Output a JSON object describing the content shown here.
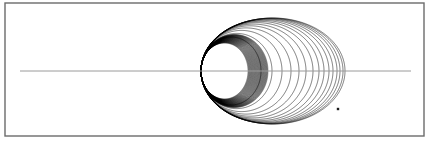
{
  "figure": {
    "title": "",
    "background_color": "#ffffff",
    "width": 429,
    "height": 145
  },
  "frame": {
    "name": "figure-border",
    "x": 5,
    "y": 3,
    "width": 419,
    "height": 133,
    "stroke_color": "#6b6b6b",
    "stroke_width": 1.4,
    "fill": "none"
  },
  "axis": {
    "name": "horizontal-axis-line",
    "x_start": 20,
    "x_end": 411,
    "y": 71,
    "stroke_color": "#9a9a9a",
    "stroke_width": 1.0
  },
  "focus": {
    "name": "common-pericenter",
    "x": 201,
    "y": 71
  },
  "marker": {
    "name": "trajectory-endpoint-marker",
    "x": 338,
    "y": 109,
    "size": 2.4,
    "color": "#1a1a1a",
    "shape": "square"
  },
  "chart_data": {
    "type": "line",
    "title": "",
    "subtitle": "",
    "xlabel": "",
    "ylabel": "",
    "grid": false,
    "legend": "none",
    "axis_line": {
      "orientation": "horizontal",
      "y": 71,
      "x_range": [
        20,
        411
      ]
    },
    "xlim": [
      5,
      424
    ],
    "ylim": [
      3,
      136
    ],
    "pericenter": {
      "x": 201,
      "y": 71
    },
    "series": [
      {
        "name": "orbit-01",
        "apocenter_x": 261,
        "semi_minor": 34.0,
        "stroke_width": 0.55,
        "opacity": 0.95,
        "arc_end_deg": 360
      },
      {
        "name": "orbit-02",
        "apocenter_x": 272,
        "semi_minor": 37.6,
        "stroke_width": 0.55,
        "opacity": 0.95,
        "arc_end_deg": 360
      },
      {
        "name": "orbit-03",
        "apocenter_x": 282,
        "semi_minor": 40.6,
        "stroke_width": 0.55,
        "opacity": 0.95,
        "arc_end_deg": 360
      },
      {
        "name": "orbit-04",
        "apocenter_x": 291,
        "semi_minor": 43.1,
        "stroke_width": 0.55,
        "opacity": 0.95,
        "arc_end_deg": 360
      },
      {
        "name": "orbit-05",
        "apocenter_x": 299,
        "semi_minor": 45.2,
        "stroke_width": 0.55,
        "opacity": 0.95,
        "arc_end_deg": 360
      },
      {
        "name": "orbit-06",
        "apocenter_x": 306,
        "semi_minor": 46.9,
        "stroke_width": 0.55,
        "opacity": 0.95,
        "arc_end_deg": 360
      },
      {
        "name": "orbit-07",
        "apocenter_x": 313,
        "semi_minor": 48.4,
        "stroke_width": 0.55,
        "opacity": 0.95,
        "arc_end_deg": 360
      },
      {
        "name": "orbit-08",
        "apocenter_x": 319,
        "semi_minor": 49.6,
        "stroke_width": 0.55,
        "opacity": 0.95,
        "arc_end_deg": 360
      },
      {
        "name": "orbit-09",
        "apocenter_x": 324,
        "semi_minor": 50.6,
        "stroke_width": 0.55,
        "opacity": 0.95,
        "arc_end_deg": 360
      },
      {
        "name": "orbit-10",
        "apocenter_x": 329,
        "semi_minor": 51.4,
        "stroke_width": 0.55,
        "opacity": 0.95,
        "arc_end_deg": 360
      },
      {
        "name": "orbit-11",
        "apocenter_x": 333,
        "semi_minor": 52.0,
        "stroke_width": 0.55,
        "opacity": 0.95,
        "arc_end_deg": 360
      },
      {
        "name": "orbit-12",
        "apocenter_x": 337,
        "semi_minor": 52.4,
        "stroke_width": 0.55,
        "opacity": 0.95,
        "arc_end_deg": 360
      },
      {
        "name": "orbit-13",
        "apocenter_x": 340,
        "semi_minor": 52.7,
        "stroke_width": 0.55,
        "opacity": 0.95,
        "arc_end_deg": 360
      },
      {
        "name": "orbit-14",
        "apocenter_x": 343,
        "semi_minor": 52.9,
        "stroke_width": 0.55,
        "opacity": 0.95,
        "arc_end_deg": 360
      },
      {
        "name": "orbit-15",
        "apocenter_x": 345,
        "semi_minor": 53.0,
        "stroke_width": 0.55,
        "opacity": 0.95,
        "arc_end_deg": 318
      }
    ],
    "dense_bundle": {
      "description": "Additional tightly-packed inner orbits that create the solid dark crescents where curves crowd near the pericenter.",
      "count": 46,
      "apocenter_start": 248,
      "apocenter_end": 268,
      "semi_minor_start": 28.0,
      "semi_minor_end": 36.5,
      "stroke_width": 0.4,
      "opacity": 0.85
    },
    "stroke_color": "#000000"
  }
}
